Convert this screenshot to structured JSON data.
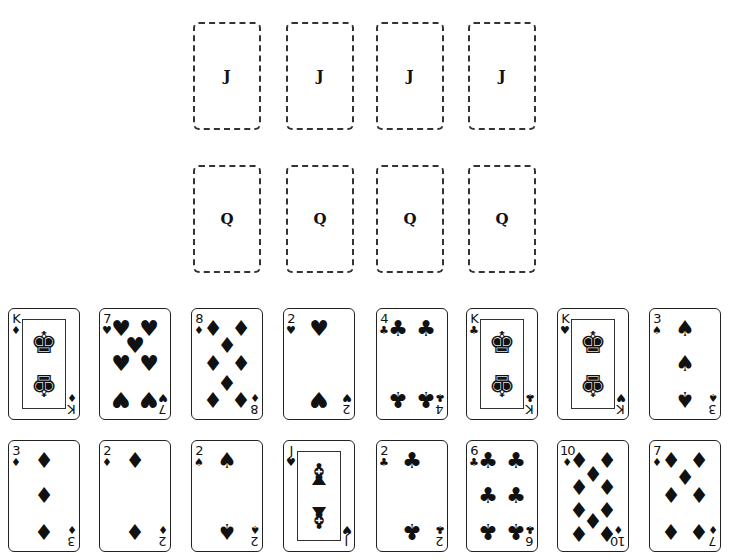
{
  "foundations": {
    "jacks": {
      "label": "J",
      "slots": [
        {
          "x": 193,
          "y": 22
        },
        {
          "x": 286,
          "y": 22
        },
        {
          "x": 376,
          "y": 22
        },
        {
          "x": 468,
          "y": 22
        }
      ]
    },
    "queens": {
      "label": "Q",
      "slots": [
        {
          "x": 193,
          "y": 165
        },
        {
          "x": 286,
          "y": 165
        },
        {
          "x": 376,
          "y": 165
        },
        {
          "x": 468,
          "y": 165
        }
      ]
    }
  },
  "tableau": {
    "row1": [
      {
        "rank": "K",
        "suit": "diamonds",
        "symbol": "♦",
        "x": 8,
        "y": 308
      },
      {
        "rank": "7",
        "suit": "hearts",
        "symbol": "♥",
        "x": 99,
        "y": 308
      },
      {
        "rank": "8",
        "suit": "diamonds",
        "symbol": "♦",
        "x": 191,
        "y": 308
      },
      {
        "rank": "2",
        "suit": "hearts",
        "symbol": "♥",
        "x": 283,
        "y": 308
      },
      {
        "rank": "4",
        "suit": "clubs",
        "symbol": "♣",
        "x": 376,
        "y": 308
      },
      {
        "rank": "K",
        "suit": "clubs",
        "symbol": "♣",
        "x": 466,
        "y": 308
      },
      {
        "rank": "K",
        "suit": "hearts",
        "symbol": "♥",
        "x": 557,
        "y": 308
      },
      {
        "rank": "3",
        "suit": "spades",
        "symbol": "♠",
        "x": 649,
        "y": 308
      }
    ],
    "row2": [
      {
        "rank": "3",
        "suit": "diamonds",
        "symbol": "♦",
        "x": 8,
        "y": 440
      },
      {
        "rank": "2",
        "suit": "diamonds",
        "symbol": "♦",
        "x": 99,
        "y": 440
      },
      {
        "rank": "2",
        "suit": "spades",
        "symbol": "♠",
        "x": 191,
        "y": 440
      },
      {
        "rank": "J",
        "suit": "hearts",
        "symbol": "♥",
        "x": 283,
        "y": 440
      },
      {
        "rank": "2",
        "suit": "clubs",
        "symbol": "♣",
        "x": 376,
        "y": 440
      },
      {
        "rank": "6",
        "suit": "clubs",
        "symbol": "♣",
        "x": 466,
        "y": 440
      },
      {
        "rank": "10",
        "suit": "diamonds",
        "symbol": "♦",
        "x": 557,
        "y": 440
      },
      {
        "rank": "7",
        "suit": "diamonds",
        "symbol": "♦",
        "x": 649,
        "y": 440
      }
    ]
  },
  "faces": {
    "K": "♚",
    "J": "♝"
  }
}
